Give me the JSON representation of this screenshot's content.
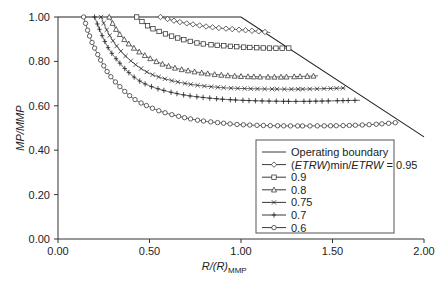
{
  "chart_data": {
    "type": "line",
    "title": "",
    "xlabel": "R/(R)MMP",
    "ylabel": "MP/MMP",
    "xlim": [
      0,
      2.0
    ],
    "ylim": [
      0,
      1.0
    ],
    "x_ticks": [
      "0.00",
      "0.50",
      "1.00",
      "1.50",
      "2.00"
    ],
    "y_ticks": [
      "0.00",
      "0.20",
      "0.40",
      "0.60",
      "0.80",
      "1.00"
    ],
    "grid": false,
    "legend_position": "lower right",
    "series": [
      {
        "name": "Operating boundary",
        "marker": "none",
        "points": [
          [
            0.0,
            1.0
          ],
          [
            1.0,
            1.0
          ],
          [
            2.0,
            0.46
          ]
        ]
      },
      {
        "name": "(ETRW)min/ETRW = 0.95",
        "marker": "diamond",
        "points": [
          [
            0.56,
            1.0
          ],
          [
            0.65,
            0.98
          ],
          [
            0.75,
            0.965
          ],
          [
            0.85,
            0.953
          ],
          [
            1.0,
            0.942
          ],
          [
            1.1,
            0.935
          ],
          [
            1.16,
            0.93
          ]
        ]
      },
      {
        "name": "0.9",
        "marker": "square",
        "points": [
          [
            0.43,
            1.0
          ],
          [
            0.5,
            0.955
          ],
          [
            0.6,
            0.92
          ],
          [
            0.7,
            0.895
          ],
          [
            0.8,
            0.878
          ],
          [
            1.0,
            0.865
          ],
          [
            1.15,
            0.86
          ],
          [
            1.27,
            0.86
          ]
        ]
      },
      {
        "name": "0.8",
        "marker": "triangle",
        "points": [
          [
            0.28,
            1.0
          ],
          [
            0.33,
            0.93
          ],
          [
            0.4,
            0.87
          ],
          [
            0.5,
            0.815
          ],
          [
            0.6,
            0.78
          ],
          [
            0.7,
            0.76
          ],
          [
            0.85,
            0.742
          ],
          [
            1.0,
            0.733
          ],
          [
            1.2,
            0.73
          ],
          [
            1.42,
            0.735
          ]
        ]
      },
      {
        "name": "0.75",
        "marker": "x",
        "points": [
          [
            0.235,
            1.0
          ],
          [
            0.28,
            0.92
          ],
          [
            0.35,
            0.84
          ],
          [
            0.45,
            0.77
          ],
          [
            0.55,
            0.73
          ],
          [
            0.7,
            0.7
          ],
          [
            0.85,
            0.685
          ],
          [
            1.0,
            0.678
          ],
          [
            1.3,
            0.675
          ],
          [
            1.57,
            0.68
          ]
        ]
      },
      {
        "name": "0.7",
        "marker": "plus",
        "points": [
          [
            0.2,
            1.0
          ],
          [
            0.25,
            0.9
          ],
          [
            0.3,
            0.83
          ],
          [
            0.4,
            0.74
          ],
          [
            0.5,
            0.69
          ],
          [
            0.65,
            0.655
          ],
          [
            0.8,
            0.637
          ],
          [
            1.0,
            0.625
          ],
          [
            1.3,
            0.62
          ],
          [
            1.65,
            0.625
          ]
        ]
      },
      {
        "name": "0.6",
        "marker": "circle",
        "points": [
          [
            0.14,
            1.0
          ],
          [
            0.17,
            0.92
          ],
          [
            0.2,
            0.86
          ],
          [
            0.25,
            0.78
          ],
          [
            0.3,
            0.72
          ],
          [
            0.4,
            0.64
          ],
          [
            0.5,
            0.595
          ],
          [
            0.6,
            0.565
          ],
          [
            0.75,
            0.537
          ],
          [
            0.9,
            0.522
          ],
          [
            1.0,
            0.515
          ],
          [
            1.2,
            0.51
          ],
          [
            1.5,
            0.51
          ],
          [
            1.7,
            0.515
          ],
          [
            1.86,
            0.525
          ]
        ]
      }
    ]
  },
  "axes": {
    "x_label_main": "R/(R)",
    "x_label_sub": "MMP",
    "y_label": "MP/MMP",
    "x_ticks": [
      "0.00",
      "0.50",
      "1.00",
      "1.50",
      "2.00"
    ],
    "y_ticks": [
      "0.00",
      "0.20",
      "0.40",
      "0.60",
      "0.80",
      "1.00"
    ]
  },
  "legend": {
    "items": [
      {
        "label": "Operating boundary"
      },
      {
        "label_prefix": "(",
        "label_italic1": "ETRW",
        "label_mid": ")min/",
        "label_italic2": "ETRW",
        "label_suffix": " = 0.95"
      },
      {
        "label": "0.9"
      },
      {
        "label": "0.8"
      },
      {
        "label": "0.75"
      },
      {
        "label": "0.7"
      },
      {
        "label": "0.6"
      }
    ]
  }
}
